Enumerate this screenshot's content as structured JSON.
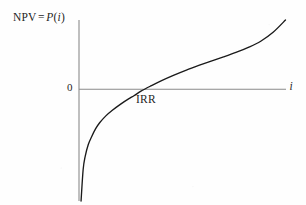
{
  "figure": {
    "background_color": "#fefefe",
    "axis_color": "#8a8a8a",
    "curve_color": "#1a1a1a",
    "text_color": "#1f1f1f"
  },
  "labels": {
    "y_axis_prefix": "NPV",
    "y_axis_equals": "=",
    "y_axis_function": "P",
    "y_axis_open_paren": "(",
    "y_axis_variable": "i",
    "y_axis_close_paren": ")",
    "y_axis_full": "NPV = P(i)",
    "origin": "0",
    "crossing": "IRR",
    "x_axis": "i"
  },
  "chart_data": {
    "type": "line",
    "title": "",
    "subtitle": "",
    "xlabel": "i",
    "ylabel": "NPV = P(i)",
    "grid": false,
    "legend": "none",
    "axis_style": "cartesian-origin-axes",
    "xlim": [
      0,
      1
    ],
    "ylim": [
      -1,
      0.62
    ],
    "annotations": [
      {
        "text": "0",
        "x": 0,
        "y": 0,
        "position": "left-of-y-axis-at-origin"
      },
      {
        "text": "IRR",
        "x": 0.266,
        "y": 0,
        "position": "below-right-of-zero-crossing"
      },
      {
        "text": "i",
        "x": 1.0,
        "y": 0,
        "position": "right-end-of-x-axis"
      },
      {
        "text": "NPV = P(i)",
        "x": 0,
        "y": 0.62,
        "position": "left-of-y-axis-top"
      }
    ],
    "zero_crossing": {
      "x": 0.266,
      "label": "IRR"
    },
    "series": [
      {
        "name": "P(i)",
        "x": [
          0.01,
          0.02,
          0.03,
          0.045,
          0.06,
          0.08,
          0.1,
          0.13,
          0.16,
          0.2,
          0.24,
          0.266,
          0.3,
          0.35,
          0.4,
          0.46,
          0.52,
          0.58,
          0.64,
          0.7,
          0.76,
          0.82,
          0.88,
          0.94,
          1.0
        ],
        "y": [
          -1.0,
          -0.72,
          -0.6,
          -0.495,
          -0.43,
          -0.355,
          -0.3,
          -0.238,
          -0.19,
          -0.135,
          -0.086,
          -0.058,
          -0.017,
          0.032,
          0.078,
          0.127,
          0.172,
          0.213,
          0.252,
          0.29,
          0.33,
          0.375,
          0.43,
          0.51,
          0.62
        ]
      }
    ]
  }
}
